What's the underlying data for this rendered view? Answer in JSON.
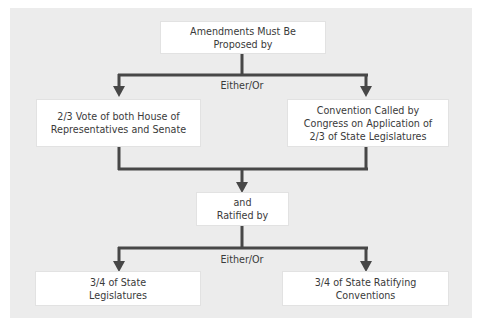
{
  "diagram": {
    "title_box": "Amendments Must Be\nProposed by",
    "proposal_choice_label": "Either/Or",
    "proposal_options": [
      "2/3 Vote of both House of\nRepresentatives and Senate",
      "Convention Called by\nCongress on Application of\n2/3 of State Legislatures"
    ],
    "join_box": "and\nRatified by",
    "ratification_choice_label": "Either/Or",
    "ratification_options": [
      "3/4 of State\nLegislatures",
      "3/4 of State Ratifying\nConventions"
    ]
  },
  "colors": {
    "panel_bg": "#ececec",
    "box_bg": "#ffffff",
    "line": "#474747",
    "text": "#3a3a3a"
  }
}
